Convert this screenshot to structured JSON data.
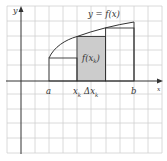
{
  "diagram": {
    "curve_label": "y = f(x)",
    "height_label_main": "f(x",
    "height_label_sub": "k",
    "height_label_close": ")",
    "axis_x_label": "x",
    "axis_y_label": "y",
    "tick_labels": {
      "a": "a",
      "b": "b",
      "xk_main": "x",
      "xk_sub": "k",
      "dx_main": "Δx",
      "dx_sub": "k"
    },
    "colors": {
      "grid": "#d0d0d0",
      "axis": "#333333",
      "curve": "#333333",
      "shaded_rect": "#cccccc",
      "background": "#ffffff"
    },
    "rectangles": [
      {
        "name": "left-rectangle",
        "shaded": false
      },
      {
        "name": "shaded-rectangle",
        "shaded": true
      },
      {
        "name": "right-rectangle",
        "shaded": false
      }
    ]
  }
}
